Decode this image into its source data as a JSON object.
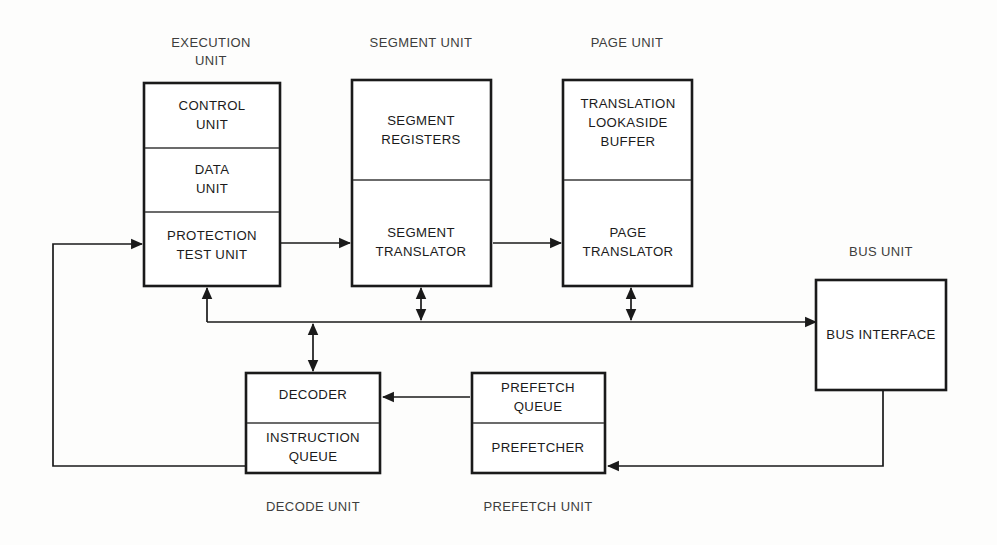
{
  "diagram": {
    "background_color": "#fdfdfc",
    "line_color": "#1a1a1a",
    "text_color": "#1b1b1b",
    "unit_titles": {
      "execution_unit_line1": "EXECUTION",
      "execution_unit_line2": "UNIT",
      "segment_unit": "SEGMENT UNIT",
      "page_unit": "PAGE UNIT",
      "bus_unit": "BUS UNIT",
      "decode_unit": "DECODE UNIT",
      "prefetch_unit": "PREFETCH UNIT"
    },
    "units": [
      {
        "id": "execution-unit",
        "title": "EXECUTION UNIT",
        "cells": [
          {
            "id": "control-unit",
            "lines": [
              "CONTROL",
              "UNIT"
            ]
          },
          {
            "id": "data-unit",
            "lines": [
              "DATA",
              "UNIT"
            ]
          },
          {
            "id": "protection-test-unit",
            "lines": [
              "PROTECTION",
              "TEST UNIT"
            ]
          }
        ]
      },
      {
        "id": "segment-unit",
        "title": "SEGMENT UNIT",
        "cells": [
          {
            "id": "segment-registers",
            "lines": [
              "SEGMENT",
              "REGISTERS"
            ]
          },
          {
            "id": "segment-translator",
            "lines": [
              "SEGMENT",
              "TRANSLATOR"
            ]
          }
        ]
      },
      {
        "id": "page-unit",
        "title": "PAGE UNIT",
        "cells": [
          {
            "id": "translation-lookaside-buffer",
            "lines": [
              "TRANSLATION",
              "LOOKASIDE",
              "BUFFER"
            ]
          },
          {
            "id": "page-translator",
            "lines": [
              "PAGE",
              "TRANSLATOR"
            ]
          }
        ]
      },
      {
        "id": "bus-unit",
        "title": "BUS UNIT",
        "cells": [
          {
            "id": "bus-interface",
            "lines": [
              "BUS INTERFACE"
            ]
          }
        ]
      },
      {
        "id": "decode-unit",
        "title": "DECODE UNIT",
        "cells": [
          {
            "id": "decoder",
            "lines": [
              "DECODER"
            ]
          },
          {
            "id": "instruction-queue",
            "lines": [
              "INSTRUCTION",
              "QUEUE"
            ]
          }
        ]
      },
      {
        "id": "prefetch-unit",
        "title": "PREFETCH UNIT",
        "cells": [
          {
            "id": "prefetch-queue",
            "lines": [
              "PREFETCH",
              "QUEUE"
            ]
          },
          {
            "id": "prefetcher",
            "lines": [
              "PREFETCHER"
            ]
          }
        ]
      }
    ],
    "cell_text": {
      "control_unit_l1": "CONTROL",
      "control_unit_l2": "UNIT",
      "data_unit_l1": "DATA",
      "data_unit_l2": "UNIT",
      "protection_test_unit_l1": "PROTECTION",
      "protection_test_unit_l2": "TEST UNIT",
      "segment_registers_l1": "SEGMENT",
      "segment_registers_l2": "REGISTERS",
      "segment_translator_l1": "SEGMENT",
      "segment_translator_l2": "TRANSLATOR",
      "tlb_l1": "TRANSLATION",
      "tlb_l2": "LOOKASIDE",
      "tlb_l3": "BUFFER",
      "page_translator_l1": "PAGE",
      "page_translator_l2": "TRANSLATOR",
      "bus_interface": "BUS INTERFACE",
      "decoder": "DECODER",
      "instruction_queue_l1": "INSTRUCTION",
      "instruction_queue_l2": "QUEUE",
      "prefetch_queue_l1": "PREFETCH",
      "prefetch_queue_l2": "QUEUE",
      "prefetcher": "PREFETCHER"
    },
    "connections": [
      {
        "id": "feedback-to-protection-test-unit",
        "from": "instruction-queue",
        "to": "protection-test-unit",
        "style": "single-arrow"
      },
      {
        "id": "protection-to-segment-translator",
        "from": "protection-test-unit",
        "to": "segment-translator",
        "style": "single-arrow"
      },
      {
        "id": "segment-to-page-translator",
        "from": "segment-translator",
        "to": "page-translator",
        "style": "single-arrow"
      },
      {
        "id": "bus-line-to-bus-interface",
        "from": "system-bus",
        "to": "bus-interface",
        "style": "single-arrow"
      },
      {
        "id": "execution-unit-to-bus",
        "from": "system-bus",
        "to": "execution-unit",
        "style": "single-arrow"
      },
      {
        "id": "segment-unit-to-bus",
        "from": "segment-unit",
        "to": "system-bus",
        "style": "double-arrow"
      },
      {
        "id": "page-unit-to-bus",
        "from": "page-unit",
        "to": "system-bus",
        "style": "double-arrow"
      },
      {
        "id": "decoder-to-bus",
        "from": "decoder",
        "to": "system-bus",
        "style": "double-arrow"
      },
      {
        "id": "prefetch-queue-to-decoder",
        "from": "prefetch-queue",
        "to": "decoder",
        "style": "single-arrow"
      },
      {
        "id": "bus-interface-to-prefetcher",
        "from": "bus-interface",
        "to": "prefetcher",
        "style": "single-arrow"
      }
    ]
  }
}
